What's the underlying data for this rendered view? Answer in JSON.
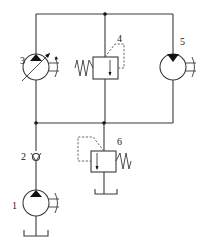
{
  "diagram": {
    "type": "hydraulic-circuit",
    "components": [
      {
        "id": "1",
        "label": "1",
        "kind": "fixed-displacement-pump",
        "drive": "motor-shaft"
      },
      {
        "id": "2",
        "label": "2",
        "kind": "check-valve"
      },
      {
        "id": "3",
        "label": "3",
        "kind": "variable-displacement-pump"
      },
      {
        "id": "4",
        "label": "4",
        "kind": "pressure-relief-valve-with-pilot"
      },
      {
        "id": "5",
        "label": "5",
        "kind": "hydraulic-motor"
      },
      {
        "id": "6",
        "label": "6",
        "kind": "pressure-relief-valve"
      }
    ],
    "colors": {
      "line": "#3a3a3a",
      "background": "#ffffff"
    }
  }
}
